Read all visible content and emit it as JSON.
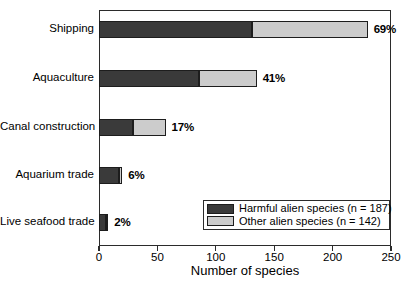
{
  "chart_data": {
    "type": "bar",
    "orientation": "horizontal",
    "stacked": true,
    "title": "",
    "xlabel": "Number of species",
    "ylabel": "",
    "xlim": [
      0,
      250
    ],
    "xticks": [
      0,
      50,
      100,
      150,
      200,
      250
    ],
    "xtick_labels": [
      "0",
      "50",
      "100",
      "150",
      "200",
      "250"
    ],
    "grid": false,
    "legend_position": "lower right",
    "categories": [
      "Shipping",
      "Aquaculture",
      "Canal construction",
      "Aquarium  trade",
      "Live seafood trade"
    ],
    "series": [
      {
        "name": "Harmful alien species (n = 187)",
        "color": "#3a3a3a",
        "values": [
          131,
          86,
          29,
          17,
          6
        ]
      },
      {
        "name": "Other alien species (n = 142)",
        "color": "#cccccc",
        "values": [
          99,
          49,
          28,
          3,
          2
        ]
      }
    ],
    "totals": [
      230,
      135,
      57,
      20,
      8
    ],
    "bar_labels": [
      "69%",
      "41%",
      "17%",
      "6%",
      "2%"
    ],
    "legend_entries": [
      {
        "label": "Harmful alien species (n = 187)",
        "swatch": "dark"
      },
      {
        "label": "Other alien species (n = 142)",
        "swatch": "light"
      }
    ]
  },
  "colors": {
    "harmful": "#3a3a3a",
    "other": "#cccccc",
    "axis": "#2b2b2b",
    "background": "#ffffff"
  }
}
